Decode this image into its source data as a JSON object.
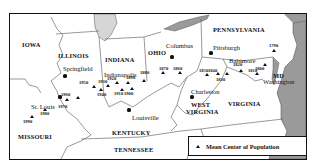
{
  "map": {
    "title": "Mean Center of Population",
    "states": [
      {
        "name": "IOWA",
        "x": 21,
        "y": 41
      },
      {
        "name": "ILLINOIS",
        "x": 57,
        "y": 52
      },
      {
        "name": "INDIANA",
        "x": 104,
        "y": 56
      },
      {
        "name": "OHIO",
        "x": 147,
        "y": 49
      },
      {
        "name": "PENNSYLVANIA",
        "x": 212,
        "y": 26
      },
      {
        "name": "MD",
        "x": 272,
        "y": 72
      },
      {
        "name": "WEST",
        "x": 190,
        "y": 101
      },
      {
        "name": "VIRGINIA",
        "x": 185,
        "y": 108
      },
      {
        "name": "VIRGINIA",
        "x": 227,
        "y": 100
      },
      {
        "name": "KENTUCKY",
        "x": 111,
        "y": 129
      },
      {
        "name": "MISSOURI",
        "x": 17,
        "y": 133
      },
      {
        "name": "TENNESSEE",
        "x": 113,
        "y": 146
      }
    ],
    "cities": [
      {
        "name": "Springfield",
        "x": 62,
        "y": 65,
        "dot_x": 64,
        "dot_y": 75
      },
      {
        "name": "Indianapolis",
        "x": 103,
        "y": 71,
        "dot_x": 0,
        "dot_y": 0
      },
      {
        "name": "Columbus",
        "x": 165,
        "y": 42,
        "dot_x": 171,
        "dot_y": 56
      },
      {
        "name": "Pittsburgh",
        "x": 212,
        "y": 44,
        "dot_x": 210,
        "dot_y": 52
      },
      {
        "name": "Baltimore",
        "x": 228,
        "y": 57,
        "dot_x": 0,
        "dot_y": 0
      },
      {
        "name": "Washington",
        "x": 262,
        "y": 78,
        "dot_x": 0,
        "dot_y": 0
      },
      {
        "name": "St. Louis",
        "x": 30,
        "y": 103,
        "dot_x": 59,
        "dot_y": 96
      },
      {
        "name": "Louisville",
        "x": 131,
        "y": 114,
        "dot_x": 128,
        "dot_y": 109
      },
      {
        "name": "Charleston",
        "x": 190,
        "y": 88,
        "dot_x": 191,
        "dot_y": 96
      }
    ],
    "population_centers": [
      {
        "year": "1790",
        "x": 273,
        "y": 50,
        "lx": 272,
        "ly": 45
      },
      {
        "year": "1800",
        "x": 264,
        "y": 64,
        "lx": 258,
        "ly": 68
      },
      {
        "year": "1810",
        "x": 256,
        "y": 73,
        "lx": 251,
        "ly": 70
      },
      {
        "year": "1820",
        "x": 240,
        "y": 70,
        "lx": 236,
        "ly": 64
      },
      {
        "year": "1830",
        "x": 226,
        "y": 73,
        "lx": 219,
        "ly": 79
      },
      {
        "year": "1840",
        "x": 217,
        "y": 73,
        "lx": 211,
        "ly": 70
      },
      {
        "year": "1850",
        "x": 206,
        "y": 74,
        "lx": 202,
        "ly": 70
      },
      {
        "year": "1860",
        "x": 179,
        "y": 72,
        "lx": 176,
        "ly": 68
      },
      {
        "year": "1870",
        "x": 162,
        "y": 72,
        "lx": 162,
        "ly": 68
      },
      {
        "year": "1880",
        "x": 143,
        "y": 80,
        "lx": 143,
        "ly": 72
      },
      {
        "year": "1890",
        "x": 127,
        "y": 82,
        "lx": 129,
        "ly": 77
      },
      {
        "year": "1900",
        "x": 131,
        "y": 88,
        "lx": 127,
        "ly": 93
      },
      {
        "year": "1910",
        "x": 121,
        "y": 89,
        "lx": 117,
        "ly": 93
      },
      {
        "year": "1920",
        "x": 116,
        "y": 82,
        "lx": 110,
        "ly": 78
      },
      {
        "year": "1930",
        "x": 107,
        "y": 85,
        "lx": 101,
        "ly": 81
      },
      {
        "year": "1940",
        "x": 100,
        "y": 89,
        "lx": 100,
        "ly": 94
      },
      {
        "year": "1950",
        "x": 93,
        "y": 86,
        "lx": 82,
        "ly": 82
      },
      {
        "year": "1960",
        "x": 77,
        "y": 97,
        "lx": 64,
        "ly": 94
      },
      {
        "year": "1970",
        "x": 66,
        "y": 99,
        "lx": 61,
        "ly": 106
      },
      {
        "year": "1980",
        "x": 44,
        "y": 109,
        "lx": 43,
        "ly": 113
      },
      {
        "year": "1990",
        "x": 31,
        "y": 116,
        "lx": 26,
        "ly": 121
      }
    ],
    "legend": {
      "symbol": "triangle-icon",
      "label": "Mean Center of Population"
    },
    "colors": {
      "water": "#9a9a9a",
      "land": "#ffffff",
      "border": "#444444",
      "ink": "#111111"
    }
  }
}
